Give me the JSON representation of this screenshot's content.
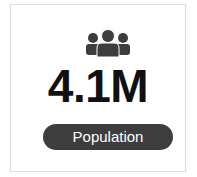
{
  "stat_card": {
    "icon": "people-group-icon",
    "value": "4.1M",
    "label": "Population",
    "colors": {
      "icon": "#3d3d3d",
      "value": "#111111",
      "pill_bg": "#3d3d3d",
      "pill_text": "#ffffff",
      "border": "#dcdcdc"
    }
  }
}
